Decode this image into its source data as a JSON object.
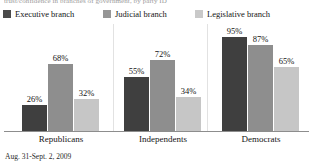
{
  "title_clipped": "trust/confidence in branches of government, by party ID",
  "footnote": "Aug. 31-Sept. 2, 2009",
  "legend": {
    "items": [
      {
        "label": "Executive branch",
        "color": "#4a4a4a",
        "swatch_name": "legend-swatch-executive"
      },
      {
        "label": "Judicial branch",
        "color": "#969696",
        "swatch_name": "legend-swatch-judicial"
      },
      {
        "label": "Legislative branch",
        "color": "#c9c9c9",
        "swatch_name": "legend-swatch-legislative"
      }
    ]
  },
  "chart_data": {
    "type": "bar",
    "title": "",
    "xlabel": "",
    "ylabel": "",
    "ylim": [
      0,
      100
    ],
    "grid": false,
    "legend_position": "top",
    "categories": [
      "Republicans",
      "Independents",
      "Democrats"
    ],
    "series": [
      {
        "name": "Executive branch",
        "color": "#3f3f3f",
        "values": [
          26,
          55,
          95
        ],
        "labels": [
          "26%",
          "55%",
          "95%"
        ]
      },
      {
        "name": "Judicial branch",
        "color": "#8e8e8e",
        "values": [
          68,
          72,
          87
        ],
        "labels": [
          "68%",
          "72%",
          "87%"
        ]
      },
      {
        "name": "Legislative branch",
        "color": "#c6c6c6",
        "values": [
          32,
          34,
          65
        ],
        "labels": [
          "32%",
          "34%",
          "65%"
        ]
      }
    ],
    "annotations": [
      "Aug. 31-Sept. 2, 2009"
    ]
  }
}
